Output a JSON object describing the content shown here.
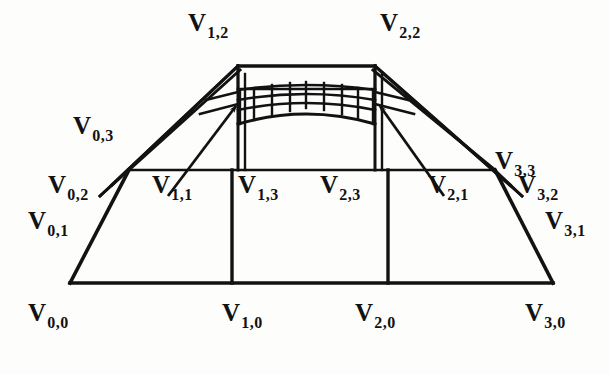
{
  "figure": {
    "background_color": "#fdfdfc",
    "ink_color": "#121212",
    "width": 610,
    "height": 374
  },
  "labels": [
    {
      "name": "v-0-0",
      "base": "V",
      "sub": "0,0",
      "x": 28,
      "y": 300
    },
    {
      "name": "v-0-1",
      "base": "V",
      "sub": "0,1",
      "x": 28,
      "y": 208
    },
    {
      "name": "v-0-2",
      "base": "V",
      "sub": "0,2",
      "x": 48,
      "y": 172
    },
    {
      "name": "v-0-3",
      "base": "V",
      "sub": "0,3",
      "x": 73,
      "y": 113
    },
    {
      "name": "v-1-0",
      "base": "V",
      "sub": "1,0",
      "x": 222,
      "y": 300
    },
    {
      "name": "v-1-1",
      "base": "V",
      "sub": "1,1",
      "x": 152,
      "y": 172
    },
    {
      "name": "v-1-2",
      "base": "V",
      "sub": "1,2",
      "x": 188,
      "y": 10
    },
    {
      "name": "v-1-3",
      "base": "V",
      "sub": "1,3",
      "x": 238,
      "y": 172
    },
    {
      "name": "v-2-0",
      "base": "V",
      "sub": "2,0",
      "x": 355,
      "y": 300
    },
    {
      "name": "v-2-1",
      "base": "V",
      "sub": "2,1",
      "x": 428,
      "y": 172
    },
    {
      "name": "v-2-2",
      "base": "V",
      "sub": "2,2",
      "x": 380,
      "y": 10
    },
    {
      "name": "v-2-3",
      "base": "V",
      "sub": "2,3",
      "x": 320,
      "y": 172
    },
    {
      "name": "v-3-0",
      "base": "V",
      "sub": "3,0",
      "x": 525,
      "y": 300
    },
    {
      "name": "v-3-1",
      "base": "V",
      "sub": "3,1",
      "x": 545,
      "y": 208
    },
    {
      "name": "v-3-2",
      "base": "V",
      "sub": "3,2",
      "x": 518,
      "y": 172
    },
    {
      "name": "v-3-3",
      "base": "V",
      "sub": "3,3",
      "x": 495,
      "y": 148
    }
  ],
  "chart_data": {
    "type": "diagram",
    "grid_indices": {
      "i": [
        0,
        1,
        2,
        3
      ],
      "j": [
        0,
        1,
        2,
        3
      ]
    },
    "vertices": [
      {
        "id": "V0,0",
        "x": 70,
        "y": 283
      },
      {
        "id": "V0,1",
        "x": 100,
        "y": 196
      },
      {
        "id": "V0,2",
        "x": 112,
        "y": 185
      },
      {
        "id": "V0,3",
        "x": 129,
        "y": 170
      },
      {
        "id": "V1,0",
        "x": 232,
        "y": 283
      },
      {
        "id": "V1,1",
        "x": 238,
        "y": 103
      },
      {
        "id": "V1,2",
        "x": 238,
        "y": 66
      },
      {
        "id": "V1,3",
        "x": 232,
        "y": 170
      },
      {
        "id": "V2,0",
        "x": 388,
        "y": 283
      },
      {
        "id": "V2,1",
        "x": 378,
        "y": 103
      },
      {
        "id": "V2,2",
        "x": 375,
        "y": 66
      },
      {
        "id": "V2,3",
        "x": 388,
        "y": 170
      },
      {
        "id": "V3,0",
        "x": 553,
        "y": 283
      },
      {
        "id": "V3,1",
        "x": 522,
        "y": 196
      },
      {
        "id": "V3,2",
        "x": 510,
        "y": 185
      },
      {
        "id": "V3,3",
        "x": 495,
        "y": 170
      }
    ],
    "base_trapezoid": [
      {
        "x": 70,
        "y": 283
      },
      {
        "x": 553,
        "y": 283
      },
      {
        "x": 495,
        "y": 170
      },
      {
        "x": 129,
        "y": 170
      }
    ],
    "ridge_rectangle": [
      {
        "x": 238,
        "y": 66
      },
      {
        "x": 375,
        "y": 66
      },
      {
        "x": 375,
        "y": 89
      },
      {
        "x": 238,
        "y": 89
      }
    ],
    "mesh_surface": {
      "longitudinal_rows": 4,
      "transverse_ribs": 9,
      "left_x": 238,
      "right_x": 375,
      "top_y": 89,
      "bottom_y": 124,
      "arc_sag": 14
    },
    "leader_arrows": [
      {
        "from_label": "V1,1",
        "tip_x": 238,
        "tip_y": 103,
        "tail_x": 168,
        "tail_y": 196
      },
      {
        "from_label": "V2,1",
        "tip_x": 378,
        "tip_y": 103,
        "tail_x": 444,
        "tail_y": 196
      }
    ]
  }
}
